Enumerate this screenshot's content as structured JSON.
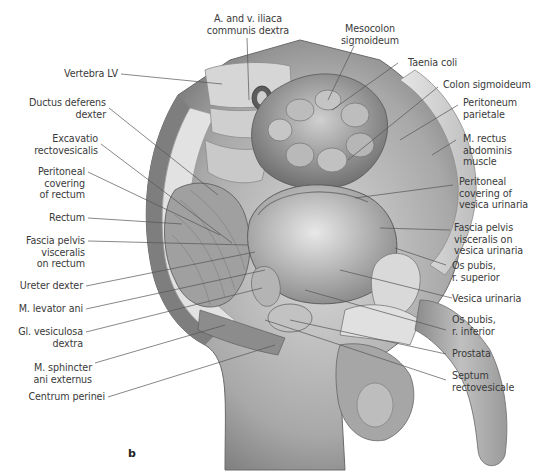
{
  "figure": {
    "panel_letter": "b"
  },
  "labels_left": [
    {
      "id": "vertebra-lv",
      "text": "Vertebra LV"
    },
    {
      "id": "ductus-deferens-dexter",
      "text": "Ductus deferens\ndexter"
    },
    {
      "id": "excavatio-rectovesicalis",
      "text": "Excavatio\nrectovesicalis"
    },
    {
      "id": "peritoneal-covering-rectum",
      "text": "Peritoneal\ncovering\nof rectum"
    },
    {
      "id": "rectum",
      "text": "Rectum"
    },
    {
      "id": "fascia-pelvis-visceralis-rectum",
      "text": "Fascia pelvis\nvisceralis\non rectum"
    },
    {
      "id": "ureter-dexter",
      "text": "Ureter dexter"
    },
    {
      "id": "m-levator-ani",
      "text": "M. levator ani"
    },
    {
      "id": "gl-vesiculosa-dextra",
      "text": "Gl. vesiculosa\ndextra"
    },
    {
      "id": "m-sphincter-ani-externus",
      "text": "M. sphincter\nani externus"
    },
    {
      "id": "centrum-perinei",
      "text": "Centrum perinei"
    }
  ],
  "labels_top": [
    {
      "id": "a-v-iliaca-communis-dextra",
      "text": "A. and v. iliaca\ncommunis dextra"
    },
    {
      "id": "mesocolon-sigmoideum",
      "text": "Mesocolon\nsigmoideum"
    }
  ],
  "labels_right": [
    {
      "id": "taenia-coli",
      "text": "Taenia coli"
    },
    {
      "id": "colon-sigmoideum",
      "text": "Colon sigmoideum"
    },
    {
      "id": "peritoneum-parietale",
      "text": "Peritoneum\nparietale"
    },
    {
      "id": "m-rectus-abdominis",
      "text": "M. rectus\nabdominis\nmuscle"
    },
    {
      "id": "peritoneal-covering-vesica",
      "text": "Peritoneal\ncovering of\nvesica urinaria"
    },
    {
      "id": "fascia-pelvis-visceralis-vesica",
      "text": "Fascia pelvis\nvisceralis on\nvesica urinaria"
    },
    {
      "id": "os-pubis-r-superior",
      "text": "Os pubis,\nr. superior"
    },
    {
      "id": "vesica-urinaria",
      "text": "Vesica urinaria"
    },
    {
      "id": "os-pubis-r-inferior",
      "text": "Os pubis,\nr. inferior"
    },
    {
      "id": "prostata",
      "text": "Prostata"
    },
    {
      "id": "septum-rectovesicale",
      "text": "Septum\nrectovesicale"
    }
  ],
  "colors": {
    "background": "#ffffff",
    "label_text": "#3a3a3a",
    "leader_line": "#555555",
    "tissue_light": "#e4e4e4",
    "tissue_mid": "#b8b8b8",
    "tissue_dark": "#6e6e6e",
    "skin": "#a9a9a9"
  }
}
